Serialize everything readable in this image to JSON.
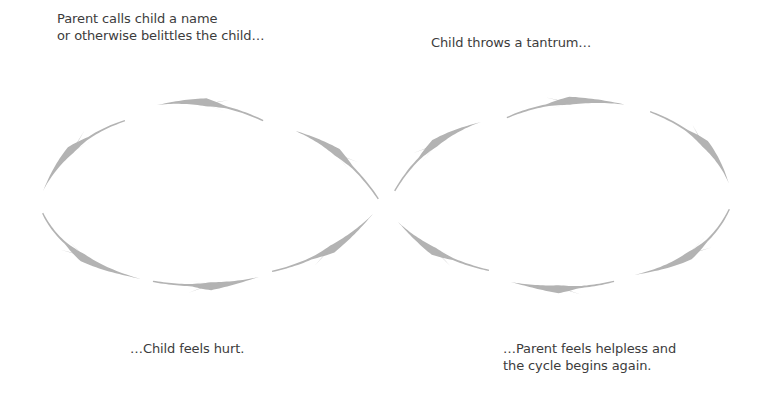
{
  "diagram": {
    "type": "infinity-cycle",
    "captions": {
      "top_left": {
        "line1": "Parent calls child a name",
        "line2": "or otherwise belittles the child…"
      },
      "top_right": {
        "line1": "Child throws a tantrum…"
      },
      "bottom_left": {
        "line1": "…Child feels hurt."
      },
      "bottom_right": {
        "line1": "…Parent feels helpless and",
        "line2": "the cycle begins again."
      }
    },
    "arrow_color": "#b3b3b3",
    "arrows": [
      {
        "id": "left-top",
        "loop": "left",
        "direction": "left",
        "tail": [
          263,
          121
        ],
        "tip": [
          157,
          105
        ],
        "bulge": [
          212,
          97
        ]
      },
      {
        "id": "left-upper-left",
        "loop": "left",
        "direction": "down-left",
        "tail": [
          125,
          121
        ],
        "tip": [
          43,
          191
        ],
        "bulge": [
          68,
          140
        ]
      },
      {
        "id": "left-lower-left",
        "loop": "left",
        "direction": "down-right",
        "tail": [
          43,
          213
        ],
        "tip": [
          141,
          279
        ],
        "bulge": [
          66,
          260
        ]
      },
      {
        "id": "left-bottom",
        "loop": "left",
        "direction": "right",
        "tail": [
          153,
          281
        ],
        "tip": [
          259,
          277
        ],
        "bulge": [
          205,
          290
        ]
      },
      {
        "id": "left-lower-right",
        "loop": "left",
        "direction": "up-right",
        "tail": [
          272,
          271
        ],
        "tip": [
          373,
          214
        ],
        "bulge": [
          330,
          258
        ]
      },
      {
        "id": "left-upper-right",
        "loop": "left",
        "direction": "up-left",
        "tail": [
          378,
          199
        ],
        "tip": [
          293,
          130
        ],
        "bulge": [
          345,
          150
        ]
      },
      {
        "id": "right-upper-left",
        "loop": "right",
        "direction": "up-right",
        "tail": [
          395,
          191
        ],
        "tip": [
          481,
          122
        ],
        "bulge": [
          425,
          140
        ]
      },
      {
        "id": "right-top",
        "loop": "right",
        "direction": "right",
        "tail": [
          507,
          118
        ],
        "tip": [
          628,
          105
        ],
        "bulge": [
          560,
          95
        ]
      },
      {
        "id": "right-upper-right",
        "loop": "right",
        "direction": "down-right",
        "tail": [
          650,
          112
        ],
        "tip": [
          729,
          184
        ],
        "bulge": [
          710,
          135
        ]
      },
      {
        "id": "right-lower-right",
        "loop": "right",
        "direction": "down-left",
        "tail": [
          729,
          209
        ],
        "tip": [
          634,
          275
        ],
        "bulge": [
          705,
          260
        ]
      },
      {
        "id": "right-bottom",
        "loop": "right",
        "direction": "left",
        "tail": [
          614,
          281
        ],
        "tip": [
          511,
          282
        ],
        "bulge": [
          565,
          293
        ]
      },
      {
        "id": "right-lower-left",
        "loop": "right",
        "direction": "up-left",
        "tail": [
          489,
          270
        ],
        "tip": [
          398,
          222
        ],
        "bulge": [
          435,
          258
        ]
      }
    ]
  }
}
